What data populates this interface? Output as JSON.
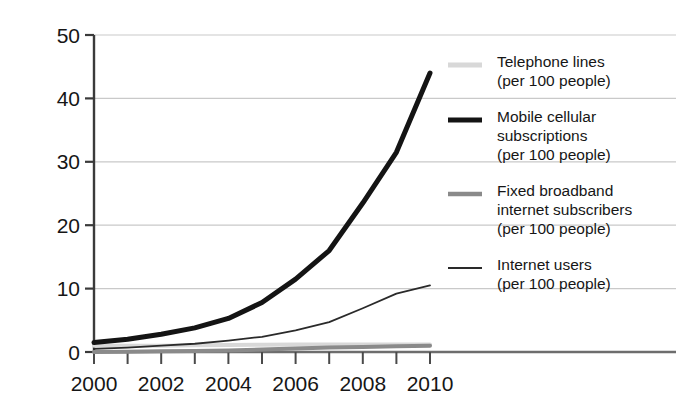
{
  "chart_data": {
    "type": "line",
    "title": "",
    "subtitle": "",
    "xlabel": "",
    "ylabel": "",
    "grid": "horizontal",
    "legend_position": "right",
    "xlim": [
      2000,
      2010
    ],
    "ylim": [
      0,
      50
    ],
    "yticks": [
      0,
      10,
      20,
      30,
      40,
      50
    ],
    "ytick_labels": [
      "0",
      "10",
      "20",
      "30",
      "40",
      "50"
    ],
    "xticks": [
      2000,
      2001,
      2002,
      2003,
      2004,
      2005,
      2006,
      2007,
      2008,
      2009,
      2010
    ],
    "xtick_labels": [
      "2000",
      "",
      "2002",
      "",
      "2004",
      "",
      "2006",
      "",
      "2008",
      "",
      "2010"
    ],
    "x": [
      2000,
      2001,
      2002,
      2003,
      2004,
      2005,
      2006,
      2007,
      2008,
      2009,
      2010
    ],
    "series": [
      {
        "name": "Telephone lines",
        "unit": "(per 100 people)",
        "label": "Telephone lines\n(per 100 people)",
        "color": "#d8d8d8",
        "width": 4,
        "values": [
          1.0,
          1.0,
          1.0,
          1.05,
          1.1,
          1.15,
          1.2,
          1.2,
          1.2,
          1.2,
          1.2
        ]
      },
      {
        "name": "Mobile cellular subscriptions",
        "unit": "(per 100 people)",
        "label": "Mobile cellular\nsubscriptions\n(per 100 people)",
        "color": "#141414",
        "width": 5,
        "values": [
          1.5,
          2.0,
          2.8,
          3.8,
          5.3,
          7.8,
          11.5,
          16.0,
          23.5,
          31.5,
          44.0
        ]
      },
      {
        "name": "Fixed broadband internet subscribers",
        "unit": "(per 100 people)",
        "label": "Fixed broadband\ninternet subscribers\n(per 100 people)",
        "color": "#8a8a8a",
        "width": 4,
        "values": [
          0.0,
          0.05,
          0.1,
          0.15,
          0.25,
          0.4,
          0.55,
          0.7,
          0.8,
          0.9,
          1.0
        ]
      },
      {
        "name": "Internet users",
        "unit": "(per 100 people)",
        "label": "Internet users\n(per 100 people)",
        "color": "#2a2a2a",
        "width": 1.8,
        "values": [
          0.5,
          0.7,
          1.0,
          1.3,
          1.8,
          2.4,
          3.4,
          4.7,
          6.9,
          9.2,
          10.5
        ]
      }
    ]
  }
}
